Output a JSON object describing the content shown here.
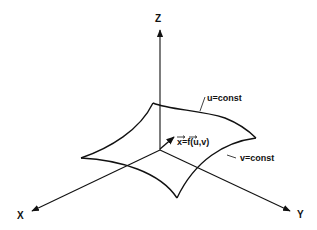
{
  "diagram": {
    "type": "parametric-surface-3d",
    "axes": {
      "z": {
        "label": "Z"
      },
      "x": {
        "label": "X"
      },
      "y": {
        "label": "Y"
      }
    },
    "annotations": {
      "u_curve": "u=const",
      "v_curve": "v=const",
      "position_vector": "x=f(u,v)"
    },
    "colors": {
      "ink": "#111111",
      "background": "#ffffff"
    }
  }
}
